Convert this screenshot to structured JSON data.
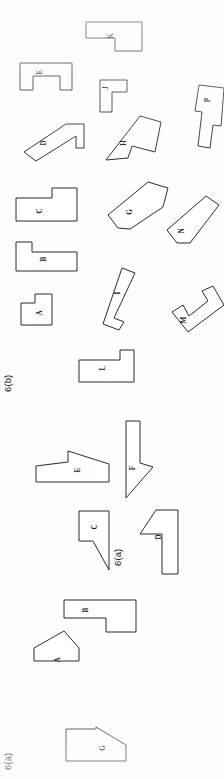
{
  "figure": {
    "orientation_degrees": -90,
    "background_color": "#fefefe",
    "line_color": "#2b2b2b",
    "label_color": "#1a1a1a",
    "captions": [
      {
        "id": "caption-6b",
        "text": "6(b)",
        "x": 11,
        "y": 392
      },
      {
        "id": "caption-6a-mid",
        "text": "6(a)",
        "x": 121,
        "y": 566
      },
      {
        "id": "caption-6a-bottom",
        "text": "6(a)",
        "x": 11,
        "y": 770
      }
    ],
    "subfigures": [
      {
        "id": "6b",
        "caption": "6(b)",
        "part_count": 12,
        "part_labels": [
          "K",
          "E",
          "J",
          "P",
          "D",
          "H",
          "C",
          "G",
          "N",
          "B",
          "A",
          "I",
          "M",
          "L"
        ]
      },
      {
        "id": "6a",
        "caption": "6(a)",
        "part_count": 6,
        "part_labels": [
          "E",
          "F",
          "C",
          "D",
          "B",
          "A",
          "G"
        ]
      }
    ],
    "parts": [
      {
        "label": "K",
        "subfigure": "6b",
        "label_x": 111,
        "label_y": 36,
        "points": "86,22 142,22 142,51 115,51 115,38 86,38"
      },
      {
        "label": "E",
        "subfigure": "6b",
        "label_x": 40,
        "label_y": 72,
        "points": "20,63 72,63 72,90 60,90 60,76 33,76 33,90 20,90"
      },
      {
        "label": "J",
        "subfigure": "6b",
        "label_x": 106,
        "label_y": 88,
        "points": "100,80 127,80 127,92 112,92 112,112 100,112"
      },
      {
        "label": "P",
        "subfigure": "6b",
        "label_x": 208,
        "label_y": 100,
        "points": "199,85 224,88 221,126 213,125 210,148 198,146 202,112 195,111"
      },
      {
        "label": "D",
        "subfigure": "6b",
        "label_x": 44,
        "label_y": 143,
        "points": "24,152 66,124 84,124 84,148 76,148 76,136 36,161"
      },
      {
        "label": "H",
        "subfigure": "6b",
        "label_x": 124,
        "label_y": 143,
        "points": "106,160 140,116 161,122 155,152 132,146 128,158"
      },
      {
        "label": "C",
        "subfigure": "6b",
        "label_x": 40,
        "label_y": 211,
        "points": "16,198 52,198 52,188 77,188 77,221 16,221"
      },
      {
        "label": "G",
        "subfigure": "6b",
        "label_x": 130,
        "label_y": 212,
        "points": "108,215 148,182 148,182 168,188 163,207 130,229 118,228"
      },
      {
        "label": "N",
        "subfigure": "6b",
        "label_x": 182,
        "label_y": 231,
        "points": "167,230 206,196 219,205 190,243 177,243"
      },
      {
        "label": "B",
        "subfigure": "6b",
        "label_x": 44,
        "label_y": 259,
        "points": "16,242 32,242 32,252 77,252 77,271 16,271"
      },
      {
        "label": "A",
        "subfigure": "6b",
        "label_x": 40,
        "label_y": 313,
        "points": "21,303 35,303 35,294 52,294 52,325 21,325"
      },
      {
        "label": "I",
        "subfigure": "6b",
        "label_x": 118,
        "label_y": 293,
        "points": "122,268 135,273 114,318 124,322 119,330 103,324"
      },
      {
        "label": "M",
        "subfigure": "6b",
        "label_x": 184,
        "label_y": 320,
        "points": "172,312 183,305 189,316 208,301 202,291 213,286 224,305 188,332"
      },
      {
        "label": "L",
        "subfigure": "6b",
        "label_x": 103,
        "label_y": 368,
        "points": "79,360 120,360 120,350 134,350 134,382 79,382"
      },
      {
        "label": "E",
        "subfigure": "6a",
        "label_x": 78,
        "label_y": 470,
        "points": "36,466 36,482 109,482 109,464 68,451 68,462"
      },
      {
        "label": "F",
        "subfigure": "6a",
        "label_x": 133,
        "label_y": 468,
        "points": "126,421 140,421 140,463 153,467 126,498"
      },
      {
        "label": "C",
        "subfigure": "6a",
        "label_x": 95,
        "label_y": 527,
        "points": "79,511 109,511 109,570 93,541 79,541"
      },
      {
        "label": "D",
        "subfigure": "6a",
        "label_x": 159,
        "label_y": 537,
        "points": "156,510 178,510 178,574 162,574 162,534 140,534"
      },
      {
        "label": "B",
        "subfigure": "6a",
        "label_x": 86,
        "label_y": 610,
        "points": "64,600 136,600 136,632 106,632 106,618 64,618"
      },
      {
        "label": "A",
        "subfigure": "6a",
        "label_x": 58,
        "label_y": 660,
        "points": "34,648 64,631 79,648 79,661 34,661"
      },
      {
        "label": "G",
        "subfigure": "6a",
        "label_x": 103,
        "label_y": 748,
        "points": "66,729 96,729 96,727 126,745 126,761 66,761"
      }
    ]
  }
}
